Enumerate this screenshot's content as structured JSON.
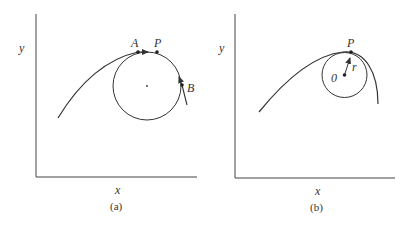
{
  "panels": [
    {
      "id": "a",
      "caption": "(a)",
      "x_axis_label": "x",
      "y_axis_label": "y",
      "points": {
        "A": "A",
        "P": "P",
        "B": "B"
      }
    },
    {
      "id": "b",
      "caption": "(b)",
      "x_axis_label": "x",
      "y_axis_label": "y",
      "points": {
        "P": "P",
        "O": "0",
        "r": "r"
      }
    }
  ],
  "colors": {
    "stroke": "#333333",
    "background": "#ffffff"
  }
}
